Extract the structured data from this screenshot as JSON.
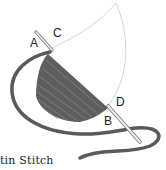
{
  "labels": {
    "a": "A",
    "b": "B",
    "c": "C",
    "d": "D"
  },
  "caption": "tin Stitch",
  "colors": {
    "thread": "#5a5a5a",
    "outline": "#c8c8c8",
    "needle": "#e8e8e8",
    "background": "#ffffff"
  }
}
